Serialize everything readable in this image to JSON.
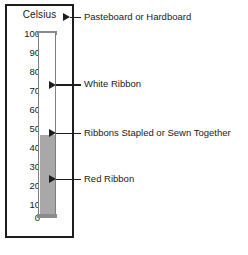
{
  "figure": {
    "title": "Celsius",
    "unit_symbol": "°C"
  },
  "chart_data": {
    "type": "bar",
    "title": "Celsius",
    "xlabel": "",
    "ylabel": "Celsius",
    "categories": [
      "Thermometer"
    ],
    "values": [
      45
    ],
    "ylim": [
      0,
      100
    ],
    "y_ticks": [
      100,
      90,
      80,
      70,
      60,
      50,
      40,
      30,
      20,
      10,
      0
    ],
    "tick_labels": [
      "100",
      "90",
      "80",
      "70",
      "60",
      "50",
      "40",
      "30",
      "20",
      "10",
      "0"
    ],
    "grid": false,
    "legend_position": "none",
    "fill_value": 45,
    "fill_color": "#a8a8a8",
    "empty_color": "#ffffff",
    "annotations": [
      {
        "label": "Pasteboard or Hardboard",
        "points_to": "board-frame"
      },
      {
        "label": "White Ribbon",
        "points_to": "tube-unfilled-70"
      },
      {
        "label": "Ribbons Stapled or Sewn Together",
        "points_to": "fill-top-45"
      },
      {
        "label": "Red Ribbon",
        "points_to": "fill-body-20"
      }
    ]
  },
  "ticks": [
    {
      "label": "100",
      "value": 100
    },
    {
      "label": "90",
      "value": 90
    },
    {
      "label": "80",
      "value": 80
    },
    {
      "label": "70",
      "value": 70
    },
    {
      "label": "60",
      "value": 60
    },
    {
      "label": "50",
      "value": 50
    },
    {
      "label": "40",
      "value": 40
    },
    {
      "label": "30",
      "value": 30
    },
    {
      "label": "20",
      "value": 20
    },
    {
      "label": "10",
      "value": 10
    },
    {
      "label": "0",
      "value": 0
    }
  ],
  "callouts": [
    {
      "id": "pasteboard",
      "label": "Pasteboard or Hardboard"
    },
    {
      "id": "white-ribbon",
      "label": "White Ribbon"
    },
    {
      "id": "stapled",
      "label": "Ribbons Stapled or Sewn Together"
    },
    {
      "id": "red-ribbon",
      "label": "Red Ribbon"
    }
  ],
  "colors": {
    "ink": "#1d1d1d",
    "tube_outline": "#7e7e7e",
    "fill": "#a8a8a8",
    "background": "#ffffff"
  }
}
